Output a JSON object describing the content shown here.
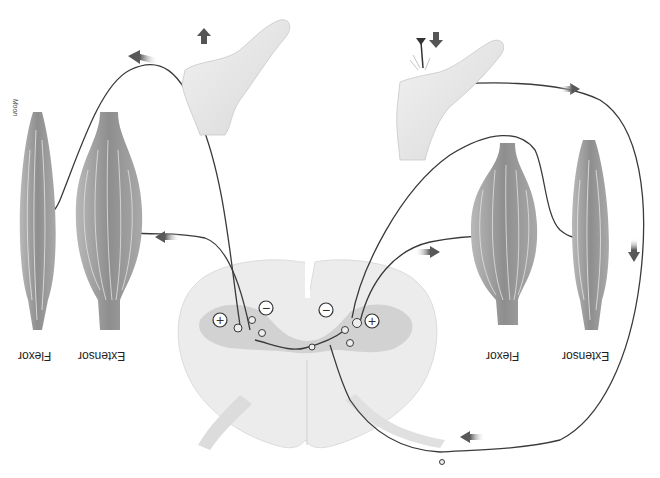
{
  "diagram": {
    "orientation": "upside-down",
    "credit": "Moon",
    "labels": {
      "left_flexor": "Flexor",
      "left_extensor": "Extensor",
      "right_flexor": "Flexor",
      "right_extensor": "Extensor"
    },
    "symbols": {
      "left_plus": "+",
      "left_minus": "−",
      "right_plus": "+",
      "right_minus": "−"
    },
    "elements": [
      {
        "name": "left-foot",
        "description": "Foot withdrawing, arrow pointing up"
      },
      {
        "name": "right-foot",
        "description": "Foot stepping on tack, arrow pointing down"
      },
      {
        "name": "spinal-cord-cross-section",
        "description": "Gray matter with interneurons, excitatory (+) and inhibitory (−) synapses"
      },
      {
        "name": "left-flexor-muscle"
      },
      {
        "name": "left-extensor-muscle"
      },
      {
        "name": "right-flexor-muscle"
      },
      {
        "name": "right-extensor-muscle"
      }
    ],
    "colors": {
      "background": "#ffffff",
      "nerve": "#3a3a3a",
      "muscle": "#8c8c8c",
      "cord": "#ececec",
      "gray_matter": "#d2d2d2",
      "arrow": "#5a5a5a",
      "skin": "#e8e8e8"
    }
  }
}
